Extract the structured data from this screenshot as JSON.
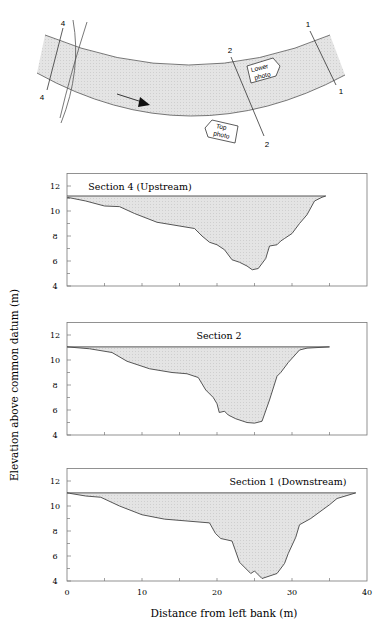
{
  "map": {
    "labels": {
      "section4_top": "4",
      "section4_bottom": "4",
      "section2_top": "2",
      "section2_bottom": "2",
      "section1_top": "1",
      "section1_bottom": "1"
    },
    "callouts": {
      "lower_photo_line1": "Lower",
      "lower_photo_line2": "photo",
      "top_photo_line1": "Top",
      "top_photo_line2": "photo"
    },
    "flow_arrow": "arrow-right-icon"
  },
  "axes": {
    "ylabel": "Elevation above common datum (m)",
    "xlabel": "Distance from left bank (m)",
    "xticks": [
      "0",
      "10",
      "20",
      "30",
      "40"
    ],
    "yticks": [
      "4",
      "6",
      "8",
      "10",
      "12"
    ]
  },
  "colors": {
    "fill": "#dcdcdc",
    "line": "#444444",
    "frame": "#777777",
    "river": "#e2e2e2"
  },
  "chart_data": [
    {
      "type": "area",
      "title": "Section 4 (Upstream)",
      "xlabel": "Distance from left bank (m)",
      "ylabel": "Elevation above common datum (m)",
      "xlim": [
        0,
        40
      ],
      "ylim": [
        4,
        13
      ],
      "water_level": 11.2,
      "water_extent": [
        0,
        34.5
      ],
      "x": [
        0,
        2.5,
        5,
        7,
        9,
        12,
        14,
        17,
        18,
        19,
        20,
        21,
        22,
        23,
        24,
        24.7,
        25.5,
        26.5,
        27,
        28,
        28.5,
        29,
        30,
        31,
        32,
        33,
        34,
        34.5
      ],
      "elevation": [
        11.1,
        10.8,
        10.4,
        10.35,
        9.8,
        9.1,
        8.9,
        8.6,
        8.0,
        7.5,
        7.3,
        6.9,
        6.1,
        5.9,
        5.6,
        5.3,
        5.4,
        6.2,
        7.2,
        7.3,
        7.6,
        7.8,
        8.2,
        9.0,
        9.7,
        10.8,
        11.1,
        11.2
      ]
    },
    {
      "type": "area",
      "title": "Section 2",
      "xlabel": "Distance from left bank (m)",
      "ylabel": "Elevation above common datum (m)",
      "xlim": [
        0,
        40
      ],
      "ylim": [
        4,
        13
      ],
      "water_level": 11.05,
      "water_extent": [
        0,
        35
      ],
      "x": [
        0,
        3,
        6,
        8,
        11,
        14,
        16,
        17.5,
        18.5,
        19.5,
        20,
        20.3,
        21,
        21.5,
        22.5,
        24,
        25,
        26,
        27,
        28,
        28.5,
        29.5,
        31,
        32,
        35
      ],
      "elevation": [
        11.05,
        10.9,
        10.6,
        9.9,
        9.3,
        9.0,
        8.9,
        8.6,
        7.6,
        7.0,
        6.5,
        5.8,
        5.9,
        5.6,
        5.3,
        5.0,
        4.95,
        5.1,
        6.8,
        8.7,
        9.0,
        9.8,
        10.8,
        10.95,
        11.05
      ]
    },
    {
      "type": "area",
      "title": "Section 1 (Downstream)",
      "xlabel": "Distance from left bank (m)",
      "ylabel": "Elevation above common datum (m)",
      "xlim": [
        0,
        40
      ],
      "ylim": [
        4,
        13
      ],
      "water_level": 11.05,
      "water_extent": [
        0,
        38.5
      ],
      "x": [
        0,
        2.5,
        4.5,
        7,
        10,
        13,
        16,
        19,
        19.8,
        20.5,
        22,
        23,
        24.5,
        25,
        26,
        28,
        29,
        29.5,
        30.5,
        31,
        32.5,
        35,
        36,
        38.5
      ],
      "elevation": [
        11.05,
        10.8,
        10.7,
        10.0,
        9.3,
        8.95,
        8.8,
        8.65,
        7.8,
        7.4,
        7.2,
        5.5,
        4.6,
        4.8,
        4.2,
        4.6,
        5.4,
        6.2,
        7.5,
        8.5,
        9.0,
        10.1,
        10.6,
        11.05
      ]
    }
  ]
}
